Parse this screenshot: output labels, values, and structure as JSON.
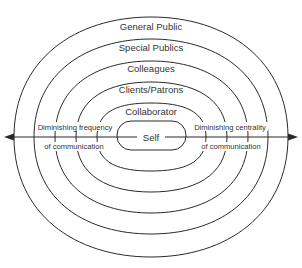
{
  "diagram": {
    "type": "concentric-rings",
    "rings": [
      {
        "label": "General Public"
      },
      {
        "label": "Special Publics"
      },
      {
        "label": "Colleagues"
      },
      {
        "label": "Clients/Patrons"
      },
      {
        "label": "Collaborator"
      },
      {
        "label": "Self"
      }
    ],
    "axis": {
      "left_label_line1": "Diminishing frequency",
      "left_label_line2": "of communication",
      "right_label_line1": "Diminishing centrality",
      "right_label_line2": "of communication"
    },
    "colors": {
      "line": "#2a2a2a",
      "text": "#333333",
      "background": "#ffffff"
    }
  }
}
